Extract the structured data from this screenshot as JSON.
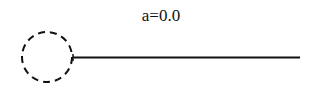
{
  "diagram": {
    "title": "a=0.0",
    "circle": {
      "cx": 47,
      "cy": 57,
      "r": 25,
      "stroke": "#111111",
      "dash": "7 5",
      "style": "dashed"
    },
    "line": {
      "x1": 73,
      "y1": 57.5,
      "x2": 300,
      "y2": 57.5,
      "stroke": "#111111"
    },
    "joint_tick": {
      "x": 73,
      "y1": 54,
      "y2": 61
    }
  }
}
